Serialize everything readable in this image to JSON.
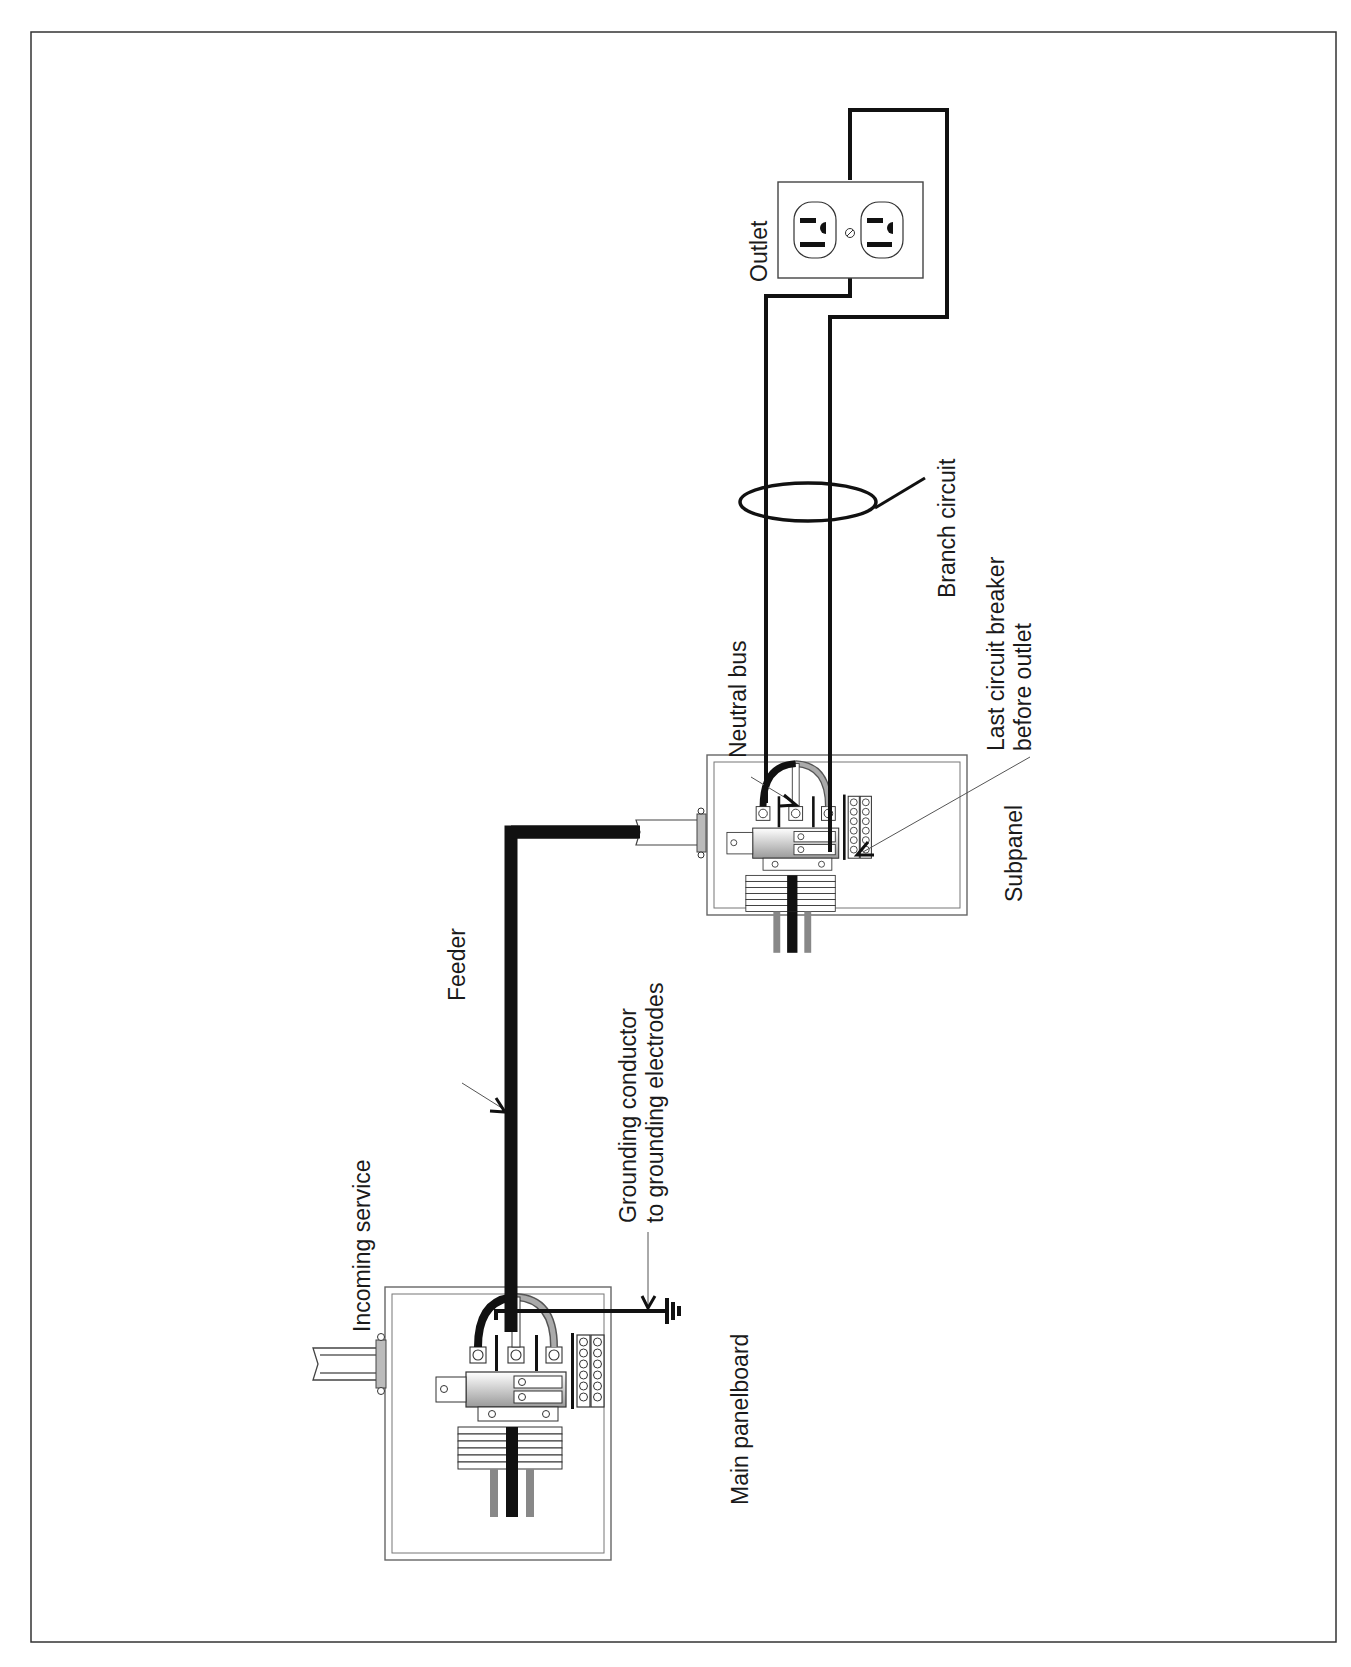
{
  "diagram": {
    "type": "electrical wiring diagram",
    "orientation": "rotated 90deg counter-clockwise",
    "labels": {
      "incoming_service": "Incoming service",
      "main_panelboard": "Main panelboard",
      "feeder": "Feeder",
      "grounding_line1": "Grounding conductor",
      "grounding_line2": "to grounding electrodes",
      "subpanel": "Subpanel",
      "neutral_bus": "Neutral bus",
      "last_breaker_line1": "Last circuit breaker",
      "last_breaker_line2": "before outlet",
      "branch_circuit": "Branch circuit",
      "outlet": "Outlet"
    },
    "components": [
      {
        "id": "main-panelboard",
        "label": "Main panelboard"
      },
      {
        "id": "feeder",
        "label": "Feeder"
      },
      {
        "id": "subpanel",
        "label": "Subpanel"
      },
      {
        "id": "branch-circuit",
        "label": "Branch circuit"
      },
      {
        "id": "outlet",
        "label": "Outlet"
      }
    ],
    "colors": {
      "line": "#111111",
      "panel_border": "#555555",
      "shade": "#8a8a8a",
      "background": "#ffffff"
    }
  }
}
